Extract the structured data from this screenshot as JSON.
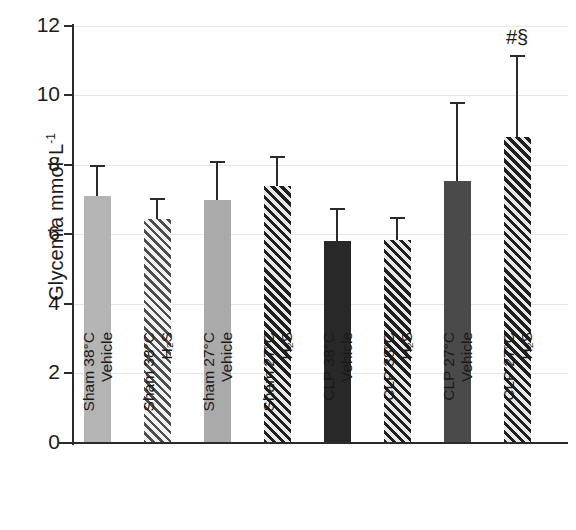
{
  "chart_data": {
    "type": "bar",
    "title": "",
    "xlabel": "",
    "ylabel": "Glycemia mmol·L",
    "ylabel_exponent": "-1",
    "ylim": [
      0,
      12
    ],
    "yticks": [
      0,
      2,
      4,
      6,
      8,
      10,
      12
    ],
    "ytick_labels": [
      "0",
      "2",
      "4",
      "6",
      "8",
      "10",
      "12"
    ],
    "grid": true,
    "legend": "none",
    "categories": [
      "Sham 38°C Vehicle",
      "Sham 38°C H2S",
      "Sham 27°C Vehicle",
      "Sham 27°C H2S",
      "CLP 38°C Vehicle",
      "CLP 38°C H2S",
      "CLP 27°C Vehicle",
      "CLP 27°C H2S"
    ],
    "values": [
      7.1,
      6.45,
      7.0,
      7.4,
      5.8,
      5.85,
      7.55,
      8.8
    ],
    "errors_upper": [
      0.85,
      0.55,
      1.05,
      0.8,
      0.9,
      0.6,
      2.2,
      2.3
    ],
    "annotations": [
      "",
      "",
      "",
      "",
      "",
      "",
      "",
      "#§"
    ],
    "bars": [
      {
        "index": 0,
        "group": "Sham",
        "temperature": "38°C",
        "treatment": "Vehicle",
        "label_line1": "Sham 38°C",
        "label_line2": "Vehicle",
        "value": 7.1,
        "error_upper": 0.85,
        "error_top": 7.95,
        "fill": "solid-light",
        "color": "#b4b4b4",
        "annotation": ""
      },
      {
        "index": 1,
        "group": "Sham",
        "temperature": "38°C",
        "treatment": "H2S",
        "label_line1": "Sham 38°C",
        "label_line2": "H₂S",
        "value": 6.45,
        "error_upper": 0.55,
        "error_top": 7.0,
        "fill": "hatch-light",
        "color": "#4d4d4d",
        "annotation": ""
      },
      {
        "index": 2,
        "group": "Sham",
        "temperature": "27°C",
        "treatment": "Vehicle",
        "label_line1": "Sham 27°C",
        "label_line2": "Vehicle",
        "value": 7.0,
        "error_upper": 1.05,
        "error_top": 8.05,
        "fill": "solid-mid",
        "color": "#aaaaaa",
        "annotation": ""
      },
      {
        "index": 3,
        "group": "Sham",
        "temperature": "27°C",
        "treatment": "H2S",
        "label_line1": "Sham 27°C",
        "label_line2": "H₂S",
        "value": 7.4,
        "error_upper": 0.8,
        "error_top": 8.2,
        "fill": "hatch-dark",
        "color": "#1f1f1f",
        "annotation": ""
      },
      {
        "index": 4,
        "group": "CLP",
        "temperature": "38°C",
        "treatment": "Vehicle",
        "label_line1": "CLP 38°C",
        "label_line2": "Vehicle",
        "value": 5.8,
        "error_upper": 0.9,
        "error_top": 6.7,
        "fill": "solid-black",
        "color": "#282828",
        "annotation": ""
      },
      {
        "index": 5,
        "group": "CLP",
        "temperature": "38°C",
        "treatment": "H2S",
        "label_line1": "CLP 38°C",
        "label_line2": "H₂S",
        "value": 5.85,
        "error_upper": 0.6,
        "error_top": 6.45,
        "fill": "hatch-dark",
        "color": "#1f1f1f",
        "annotation": ""
      },
      {
        "index": 6,
        "group": "CLP",
        "temperature": "27°C",
        "treatment": "Vehicle",
        "label_line1": "CLP 27°C",
        "label_line2": "Vehicle",
        "value": 7.55,
        "error_upper": 2.2,
        "error_top": 9.75,
        "fill": "solid-dark",
        "color": "#4a4a4a",
        "annotation": ""
      },
      {
        "index": 7,
        "group": "CLP",
        "temperature": "27°C",
        "treatment": "H2S",
        "label_line1": "CLP 27°C",
        "label_line2": "H₂S",
        "value": 8.8,
        "error_upper": 2.3,
        "error_top": 11.1,
        "fill": "hatch-dark",
        "color": "#1f1f1f",
        "annotation": "#§"
      }
    ]
  }
}
